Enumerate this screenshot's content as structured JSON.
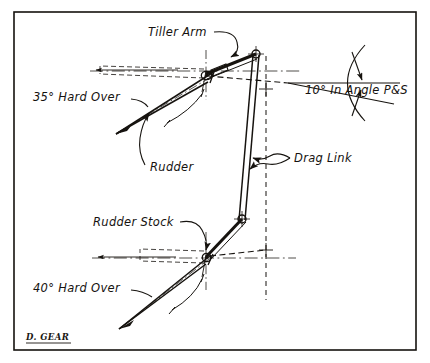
{
  "document": {
    "type": "engineering-drawing",
    "subject": "Rudder linkage geometry",
    "background_color": "#ffffff",
    "ink_color": "#16130f"
  },
  "frame": {
    "name": "drawing-border",
    "x": 14,
    "y": 12,
    "width": 402,
    "height": 338
  },
  "labels": {
    "tiller_arm": "Tiller Arm",
    "angle_upper": "35° Hard Over",
    "in_angle": "10° In Angle P&S",
    "rudder": "Rudder",
    "drag_link": "Drag Link",
    "rudder_stock": "Rudder Stock",
    "angle_lower": "40° Hard Over"
  },
  "signature": {
    "text": "D. GEAR"
  },
  "annotations": [
    {
      "id": "tiller-arm",
      "label": "Tiller Arm",
      "x": 150,
      "y": 36,
      "leader": "curve-down-right"
    },
    {
      "id": "angle-upper",
      "label": "35° Hard Over",
      "x": 33,
      "y": 101,
      "leader": "curve-right"
    },
    {
      "id": "in-angle",
      "label": "10° In Angle P&S",
      "x": 305,
      "y": 89,
      "leader": "none"
    },
    {
      "id": "rudder",
      "label": "Rudder",
      "x": 148,
      "y": 167,
      "leader": "curve-up"
    },
    {
      "id": "drag-link",
      "label": "Drag Link",
      "x": 294,
      "y": 161,
      "leader": "s-curve-left"
    },
    {
      "id": "rudder-stock",
      "label": "Rudder Stock",
      "x": 93,
      "y": 226,
      "leader": "curve-down-right"
    },
    {
      "id": "angle-lower",
      "label": "40° Hard Over",
      "x": 33,
      "y": 292,
      "leader": "curve-right"
    }
  ],
  "geometry": {
    "upper_assembly": {
      "pivot": {
        "x": 206,
        "y": 74
      },
      "pin": {
        "x": 256,
        "y": 54
      },
      "rudder_angle_deg": 35,
      "blade_tip": {
        "x": 114,
        "y": 135
      }
    },
    "lower_assembly": {
      "pivot": {
        "x": 206,
        "y": 257
      },
      "pin": {
        "x": 242,
        "y": 219
      },
      "rudder_angle_deg": 40,
      "blade_tip": {
        "x": 117,
        "y": 330
      }
    },
    "drag_link": {
      "top": {
        "x": 256,
        "y": 54
      },
      "bottom": {
        "x": 242,
        "y": 219
      }
    },
    "reference_line": {
      "x": 266,
      "y_top": 56,
      "y_bottom": 300
    },
    "in_angle_vertex": {
      "x": 288,
      "y": 83,
      "angle_deg": 10
    }
  }
}
